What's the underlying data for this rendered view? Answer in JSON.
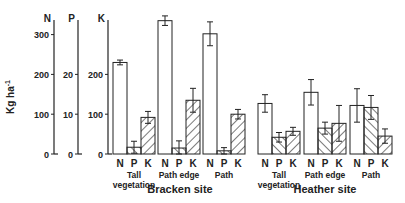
{
  "chart_data": {
    "type": "bar",
    "title": "",
    "ylabel": "Kg ha-1",
    "ylabel_main": "Kg ha",
    "ylabel_sup": "-1",
    "axes": [
      {
        "name": "N",
        "ticks": [
          0,
          100,
          200,
          300
        ],
        "ylim": [
          0,
          340
        ]
      },
      {
        "name": "P",
        "ticks": [
          0,
          10,
          20
        ],
        "ylim": [
          0,
          34
        ]
      },
      {
        "name": "K",
        "ticks": [
          0,
          100,
          200
        ],
        "ylim": [
          0,
          340
        ]
      }
    ],
    "series_labels": [
      "N",
      "P",
      "K"
    ],
    "sites": [
      {
        "name": "Bracken site",
        "groups": [
          {
            "label": [
              "Tall",
              "vegetation"
            ],
            "N": 230,
            "N_err": 6,
            "P": 1.7,
            "P_err": 1.5,
            "K": 92,
            "K_err": 15
          },
          {
            "label": [
              "Path edge"
            ],
            "N": 335,
            "N_err": 12,
            "P": 1.5,
            "P_err": 1.8,
            "K": 135,
            "K_err": 30
          },
          {
            "label": [
              "Path"
            ],
            "N": 302,
            "N_err": 30,
            "P": 0.8,
            "P_err": 0.8,
            "K": 100,
            "K_err": 12
          }
        ]
      },
      {
        "name": "Heather site",
        "groups": [
          {
            "label": [
              "Tall",
              "vegetation"
            ],
            "N": 127,
            "N_err": 22,
            "P": 4.2,
            "P_err": 1.2,
            "K": 57,
            "K_err": 10
          },
          {
            "label": [
              "Path edge"
            ],
            "N": 155,
            "N_err": 32,
            "P": 6.5,
            "P_err": 1.5,
            "K": 77,
            "K_err": 45
          },
          {
            "label": [
              "Path"
            ],
            "N": 122,
            "N_err": 42,
            "P": 11.7,
            "P_err": 3,
            "K": 45,
            "K_err": 18
          }
        ]
      }
    ],
    "grid": false,
    "legend": "none"
  }
}
